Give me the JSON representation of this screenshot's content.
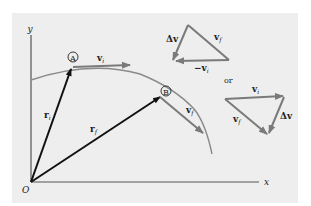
{
  "diagram": {
    "axes": {
      "x_label": "x",
      "y_label": "y",
      "origin_label": "O"
    },
    "points": [
      {
        "id": "A",
        "label": "A"
      },
      {
        "id": "B",
        "label": "B"
      }
    ],
    "vectors": {
      "ri": {
        "main": "r",
        "sub": "i"
      },
      "rf": {
        "main": "r",
        "sub": "f"
      },
      "vi": {
        "main": "v",
        "sub": "i"
      },
      "vf": {
        "main": "v",
        "sub": "f"
      }
    },
    "triangle1": {
      "dv": "Δv",
      "vf": {
        "main": "v",
        "sub": "f"
      },
      "neg_vi": {
        "main": "−v",
        "sub": "i"
      }
    },
    "connector": "or",
    "triangle2": {
      "vi": {
        "main": "v",
        "sub": "i"
      },
      "vf": {
        "main": "v",
        "sub": "f"
      },
      "dv": "Δv"
    },
    "colors": {
      "background": "#eeeeee",
      "position_vector": "#111111",
      "velocity_vector": "#7a7a7a",
      "curve": "#8a8a8a",
      "axis": "#555555"
    }
  }
}
